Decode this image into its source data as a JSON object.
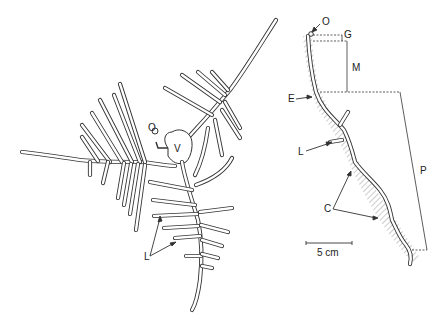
{
  "figure": {
    "left_panel": {
      "description": "Plan view of burrow system",
      "labels": {
        "opening": "O",
        "vestibule": "V",
        "lateral": "L"
      }
    },
    "right_panel": {
      "description": "Vertical section of burrow",
      "labels": {
        "opening": "O",
        "G": "G",
        "M": "M",
        "E": "E",
        "lateral": "L",
        "P": "P",
        "C": "C"
      },
      "scale_bar": {
        "label": "5 cm"
      }
    },
    "colors": {
      "stroke": "#333333",
      "hatch": "#999999",
      "background": "#ffffff"
    }
  }
}
